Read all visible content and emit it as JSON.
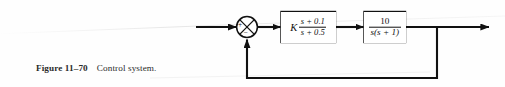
{
  "figure": {
    "label": "Figure 11–70",
    "caption": "Control system."
  },
  "diagram": {
    "type": "control-block-diagram",
    "summing_junction": {
      "name": "summing-junction",
      "shape": "circle-with-cross",
      "signs": {
        "input_left": "+",
        "input_bottom": "−"
      }
    },
    "blocks": [
      {
        "id": "controller",
        "gain": "K",
        "numerator": "s + 0.1",
        "denominator": "s + 0.5",
        "transfer_function": "K(s + 0.1)/(s + 0.5)"
      },
      {
        "id": "plant",
        "gain": "",
        "numerator": "10",
        "denominator": "s(s + 1)",
        "transfer_function": "10/(s(s + 1))"
      }
    ],
    "signals": {
      "input_arrow": "reference-input",
      "output_arrow": "plant-output",
      "feedback": "unity-feedback"
    },
    "colors": {
      "line": "#111111",
      "background": "#fefefe",
      "text": "#111111"
    }
  }
}
